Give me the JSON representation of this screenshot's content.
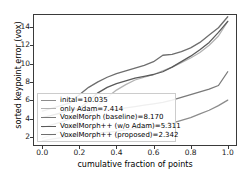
{
  "chart_data": {
    "type": "line",
    "title": "",
    "xlabel": "cumulative fraction of points",
    "ylabel": "sorted keypoint error (vox)",
    "xlim": [
      -0.05,
      1.05
    ],
    "ylim": [
      15.4,
      1.0
    ],
    "y_inverted": true,
    "grid": false,
    "legend_position": "lower left",
    "xticks": [
      "0.0",
      "0.2",
      "0.4",
      "0.6",
      "0.8",
      "1.0"
    ],
    "xtick_values": [
      0.0,
      0.2,
      0.4,
      0.6,
      0.8,
      1.0
    ],
    "yticks": [
      "2",
      "4",
      "6",
      "8",
      "10",
      "12",
      "14"
    ],
    "ytick_values": [
      2,
      4,
      6,
      8,
      10,
      12,
      14
    ],
    "x": [
      0.0,
      0.05,
      0.1,
      0.15,
      0.2,
      0.25,
      0.3,
      0.35,
      0.4,
      0.45,
      0.5,
      0.55,
      0.6,
      0.65,
      0.7,
      0.75,
      0.8,
      0.85,
      0.9,
      0.95,
      1.0
    ],
    "series": [
      {
        "name": "inital=10.035",
        "color": "#8c8c8c",
        "values": [
          1.55,
          1.75,
          1.9,
          2.05,
          2.2,
          2.3,
          2.4,
          2.5,
          2.6,
          2.75,
          2.9,
          3.0,
          3.1,
          3.25,
          3.5,
          3.8,
          4.1,
          4.5,
          4.9,
          5.4,
          6.0
        ]
      },
      {
        "name": "only Adam=7.414",
        "color": "#b3b3b3",
        "values": [
          1.85,
          2.2,
          2.6,
          3.0,
          3.6,
          4.4,
          5.4,
          6.3,
          7.1,
          7.7,
          8.2,
          8.5,
          8.8,
          9.2,
          9.6,
          10.1,
          10.6,
          11.2,
          12.0,
          13.0,
          14.6
        ]
      },
      {
        "name": "VoxelMorph (baseline)=8.170",
        "color": "#7a7a7a",
        "values": [
          3.0,
          3.3,
          3.6,
          3.95,
          4.3,
          4.6,
          4.9,
          4.95,
          5.0,
          5.15,
          5.3,
          5.45,
          5.6,
          5.75,
          6.0,
          6.3,
          6.6,
          6.9,
          7.2,
          7.6,
          9.1
        ]
      },
      {
        "name": "VoxelMorph++ (w/o Adam)=5.311",
        "color": "#5a5a5a",
        "values": [
          4.1,
          4.35,
          4.6,
          4.9,
          5.1,
          5.9,
          6.8,
          7.4,
          7.8,
          8.1,
          8.4,
          8.6,
          8.8,
          9.1,
          9.6,
          10.2,
          10.8,
          11.5,
          12.3,
          13.4,
          14.6
        ]
      },
      {
        "name": "VoxelMorph++ (proposed)=2.342",
        "color": "#6e6e6e",
        "values": [
          4.8,
          5.1,
          5.4,
          5.7,
          6.6,
          7.4,
          8.0,
          8.5,
          8.9,
          9.2,
          9.5,
          9.8,
          10.2,
          10.9,
          11.0,
          11.3,
          11.7,
          12.3,
          13.1,
          13.9,
          15.1
        ]
      }
    ]
  }
}
